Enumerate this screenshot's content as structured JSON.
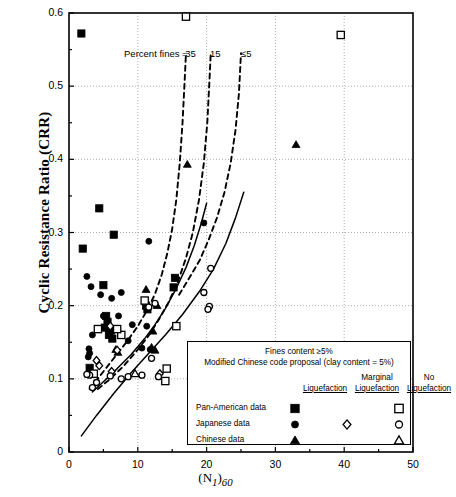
{
  "chart_data": {
    "type": "scatter",
    "title": "",
    "xlabel": "(N1)60",
    "ylabel": "Cyclic Resistance Ratio (CRR)",
    "xlim": [
      0,
      50
    ],
    "ylim": [
      0,
      0.6
    ],
    "xticks": [
      "0",
      "10",
      "20",
      "30",
      "40",
      "50"
    ],
    "yticks": [
      "0",
      "0.1",
      "0.2",
      "0.3",
      "0.4",
      "0.5",
      "0.6"
    ],
    "grid": true,
    "legend_position": "inside-lower-right",
    "annotations": [
      {
        "text": "Percent fines =",
        "x": 8.0,
        "y": 0.543
      },
      {
        "text": "35",
        "x": 16.9,
        "y": 0.543
      },
      {
        "text": "15",
        "x": 20.5,
        "y": 0.543
      },
      {
        "text": "≤5",
        "x": 25.0,
        "y": 0.543
      }
    ],
    "series": [
      {
        "name": "Pan-American data – Liquefaction",
        "marker": "filled-square",
        "points": [
          [
            1.8,
            0.572
          ],
          [
            4.4,
            0.333
          ],
          [
            6.5,
            0.297
          ],
          [
            2.0,
            0.278
          ],
          [
            5.0,
            0.228
          ],
          [
            5.4,
            0.186
          ],
          [
            5.6,
            0.178
          ],
          [
            6.1,
            0.166
          ],
          [
            5.8,
            0.16
          ],
          [
            15.4,
            0.238
          ],
          [
            15.2,
            0.225
          ],
          [
            11.2,
            0.2
          ],
          [
            11.4,
            0.195
          ],
          [
            6.3,
            0.155
          ],
          [
            3.0,
            0.115
          ],
          [
            5.2,
            0.17
          ]
        ]
      },
      {
        "name": "Japanese data – Liquefaction",
        "marker": "filled-circle",
        "points": [
          [
            2.6,
            0.24
          ],
          [
            3.2,
            0.226
          ],
          [
            4.6,
            0.215
          ],
          [
            6.2,
            0.21
          ],
          [
            7.6,
            0.218
          ],
          [
            19.6,
            0.313
          ],
          [
            11.6,
            0.288
          ],
          [
            5.0,
            0.186
          ],
          [
            7.2,
            0.186
          ],
          [
            3.4,
            0.16
          ],
          [
            2.9,
            0.141
          ],
          [
            3.0,
            0.135
          ],
          [
            9.2,
            0.174
          ],
          [
            11.3,
            0.172
          ],
          [
            10.6,
            0.142
          ],
          [
            11.8,
            0.14
          ],
          [
            8.6,
            0.152
          ],
          [
            2.8,
            0.13
          ]
        ]
      },
      {
        "name": "Chinese data – Liquefaction",
        "marker": "filled-triangle",
        "points": [
          [
            17.2,
            0.393
          ],
          [
            33.0,
            0.42
          ],
          [
            11.2,
            0.222
          ],
          [
            12.8,
            0.2
          ],
          [
            12.2,
            0.165
          ],
          [
            12.0,
            0.143
          ],
          [
            6.8,
            0.14
          ],
          [
            12.5,
            0.139
          ],
          [
            7.1,
            0.136
          ]
        ]
      },
      {
        "name": "Japanese data – Marginal Liquefaction",
        "marker": "open-diamond",
        "points": [
          [
            6.0,
            0.172
          ],
          [
            4.0,
            0.125
          ],
          [
            7.0,
            0.139
          ],
          [
            4.4,
            0.118
          ],
          [
            6.2,
            0.11
          ],
          [
            13.2,
            0.107
          ]
        ]
      },
      {
        "name": "Pan-American data – No Liquefaction",
        "marker": "open-square",
        "points": [
          [
            17.0,
            0.595
          ],
          [
            39.5,
            0.57
          ],
          [
            4.2,
            0.168
          ],
          [
            7.6,
            0.16
          ],
          [
            15.6,
            0.172
          ],
          [
            3.6,
            0.107
          ],
          [
            14.2,
            0.114
          ],
          [
            14.0,
            0.097
          ],
          [
            11.0,
            0.207
          ],
          [
            7.0,
            0.168
          ]
        ]
      },
      {
        "name": "Japanese data – No Liquefaction",
        "marker": "open-circle",
        "points": [
          [
            20.6,
            0.251
          ],
          [
            19.6,
            0.218
          ],
          [
            20.4,
            0.199
          ],
          [
            20.2,
            0.195
          ],
          [
            12.5,
            0.203
          ],
          [
            11.6,
            0.198
          ],
          [
            3.0,
            0.105
          ],
          [
            4.0,
            0.095
          ],
          [
            3.4,
            0.088
          ],
          [
            6.0,
            0.104
          ],
          [
            7.6,
            0.1
          ],
          [
            8.6,
            0.103
          ],
          [
            10.6,
            0.105
          ],
          [
            12.0,
            0.128
          ],
          [
            13.0,
            0.103
          ],
          [
            2.6,
            0.106
          ]
        ]
      },
      {
        "name": "Chinese data – No Liquefaction",
        "marker": "open-triangle",
        "points": [
          [
            9.6,
            0.107
          ]
        ]
      }
    ],
    "curves": [
      {
        "name": "CRR curve, percent fines = 35",
        "style": "dashed",
        "points": [
          [
            3.0,
            0.086
          ],
          [
            4.0,
            0.098
          ],
          [
            5.5,
            0.116
          ],
          [
            7.0,
            0.134
          ],
          [
            8.5,
            0.152
          ],
          [
            10.0,
            0.172
          ],
          [
            11.5,
            0.196
          ],
          [
            12.5,
            0.216
          ],
          [
            13.5,
            0.243
          ],
          [
            14.3,
            0.272
          ],
          [
            15.0,
            0.305
          ],
          [
            15.6,
            0.345
          ],
          [
            16.1,
            0.395
          ],
          [
            16.5,
            0.45
          ],
          [
            16.8,
            0.505
          ],
          [
            17.0,
            0.545
          ]
        ]
      },
      {
        "name": "CRR curve, percent fines = 15",
        "style": "dashed",
        "points": [
          [
            4.2,
            0.086
          ],
          [
            6.0,
            0.1
          ],
          [
            8.0,
            0.118
          ],
          [
            10.0,
            0.14
          ],
          [
            11.5,
            0.158
          ],
          [
            13.0,
            0.18
          ],
          [
            14.5,
            0.205
          ],
          [
            15.8,
            0.232
          ],
          [
            17.0,
            0.265
          ],
          [
            18.0,
            0.3
          ],
          [
            18.9,
            0.345
          ],
          [
            19.6,
            0.395
          ],
          [
            20.1,
            0.45
          ],
          [
            20.4,
            0.505
          ],
          [
            20.6,
            0.545
          ]
        ]
      },
      {
        "name": "CRR curve, percent fines ≤ 5 (dashed upper)",
        "style": "dashed",
        "points": [
          [
            16.0,
            0.215
          ],
          [
            17.5,
            0.238
          ],
          [
            19.0,
            0.262
          ],
          [
            20.3,
            0.29
          ],
          [
            21.5,
            0.32
          ],
          [
            22.6,
            0.355
          ],
          [
            23.5,
            0.395
          ],
          [
            24.2,
            0.44
          ],
          [
            24.7,
            0.49
          ],
          [
            25.0,
            0.545
          ]
        ]
      },
      {
        "name": "CRR boundary curve (solid, fines-rich)",
        "style": "solid",
        "points": [
          [
            3.4,
            0.082
          ],
          [
            5.0,
            0.096
          ],
          [
            7.0,
            0.114
          ],
          [
            9.0,
            0.133
          ],
          [
            11.0,
            0.155
          ],
          [
            12.5,
            0.174
          ],
          [
            14.0,
            0.196
          ],
          [
            15.5,
            0.222
          ],
          [
            17.0,
            0.252
          ],
          [
            18.2,
            0.282
          ],
          [
            19.2,
            0.312
          ],
          [
            20.0,
            0.34
          ]
        ]
      },
      {
        "name": "CRR boundary curve (solid, clean sand)",
        "style": "solid",
        "points": [
          [
            1.8,
            0.022
          ],
          [
            4.0,
            0.05
          ],
          [
            6.5,
            0.08
          ],
          [
            9.0,
            0.108
          ],
          [
            11.5,
            0.134
          ],
          [
            14.0,
            0.16
          ],
          [
            16.5,
            0.188
          ],
          [
            19.0,
            0.22
          ],
          [
            21.0,
            0.25
          ],
          [
            22.8,
            0.285
          ],
          [
            24.2,
            0.32
          ],
          [
            25.4,
            0.355
          ]
        ]
      }
    ]
  },
  "legend": {
    "title_line1": "Fines content ≥5%",
    "title_line2": "Modified Chinese code proposal (clay content = 5%)",
    "col_headers": [
      "Liquefaction",
      "Marginal Liquefaction",
      "No Liquefaction"
    ],
    "col_headers_split": [
      {
        "top": "",
        "bottom": "Liquefaction"
      },
      {
        "top": "Marginal",
        "bottom": "Liquefaction"
      },
      {
        "top": "No",
        "bottom": "Liquefaction"
      }
    ],
    "rows": [
      {
        "label": "Pan-American data",
        "liquefaction": "filled-square",
        "marginal": "",
        "no_liquefaction": "open-square"
      },
      {
        "label": "Japanese data",
        "liquefaction": "filled-circle",
        "marginal": "open-diamond",
        "no_liquefaction": "open-circle"
      },
      {
        "label": "Chinese data",
        "liquefaction": "filled-triangle",
        "marginal": "",
        "no_liquefaction": "open-triangle"
      }
    ]
  },
  "axis": {
    "xlabel_main": "(N",
    "xlabel_sub1": "1",
    "xlabel_mid": ")",
    "xlabel_sub2": "60",
    "ylabel": "Cyclic Resistance Ratio (CRR)"
  },
  "colors": {
    "foreground": "#000000",
    "background": "#ffffff",
    "grid": "#9a9a9a"
  }
}
